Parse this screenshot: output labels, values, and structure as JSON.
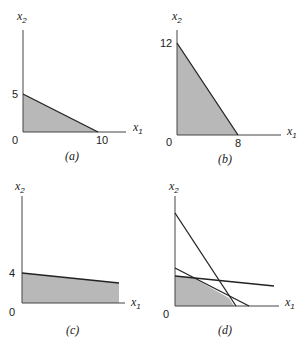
{
  "figure": {
    "colors": {
      "region_fill": "#b8b8b8",
      "lines": "#222222",
      "axes": "#444444",
      "background": "#ffffff"
    },
    "axis_labels": {
      "x": "x",
      "x_sub": "1",
      "y": "x",
      "y_sub": "2"
    },
    "panels": [
      {
        "id": "a",
        "caption": "(a)",
        "origin_label": "0",
        "y_intercept_label": "5",
        "x_intercept_label": "10",
        "constraint": "x1 + 2x2 <= 10",
        "region_vertices": [
          [
            0,
            0
          ],
          [
            0,
            5
          ],
          [
            10,
            0
          ]
        ]
      },
      {
        "id": "b",
        "caption": "(b)",
        "origin_label": "0",
        "y_intercept_label": "12",
        "x_intercept_label": "8",
        "constraint": "3x1 + 2x2 <= 24",
        "region_vertices": [
          [
            0,
            0
          ],
          [
            0,
            12
          ],
          [
            8,
            0
          ]
        ]
      },
      {
        "id": "c",
        "caption": "(c)",
        "origin_label": "0",
        "y_intercept_label": "4",
        "x_intercept_label": "",
        "constraint": "slightly decreasing upper bound starting at x2 = 4",
        "region_vertices": "bounded by x1-axis, x2-axis and line from (0,4), truncated at right"
      },
      {
        "id": "d",
        "caption": "(d)",
        "origin_label": "0",
        "y_intercept_label": "",
        "x_intercept_label": "",
        "constraint": "intersection of the three constraints from (a), (b), (c)",
        "lines": [
          "steep line (b)",
          "medium line (a)",
          "shallow line (c)"
        ]
      }
    ]
  }
}
